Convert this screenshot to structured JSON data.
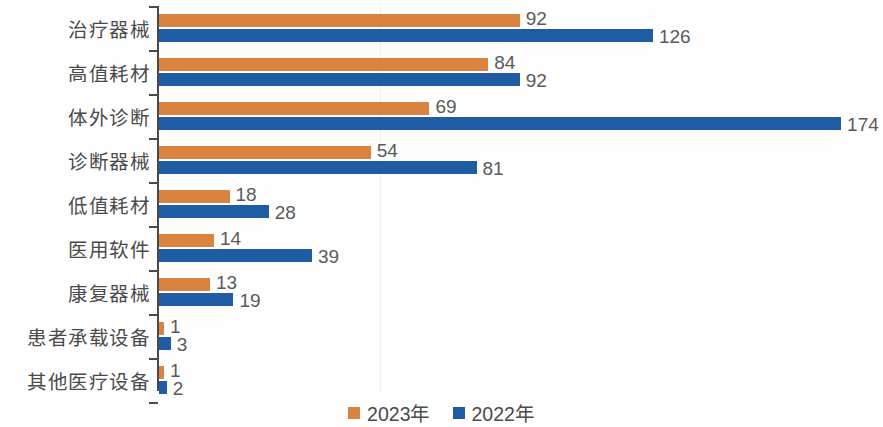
{
  "chart_data": {
    "type": "bar",
    "orientation": "horizontal",
    "title": "",
    "subtitle": "",
    "xlabel": "",
    "ylabel": "",
    "xlim": [
      0,
      180
    ],
    "grid": true,
    "legend_position": "bottom",
    "categories": [
      "治疗器械",
      "高值耗材",
      "体外诊断",
      "诊断器械",
      "低值耗材",
      "医用软件",
      "康复器械",
      "患者承载设备",
      "其他医疗设备"
    ],
    "series": [
      {
        "name": "2023年",
        "color": "#D9833E",
        "values": [
          92,
          84,
          69,
          54,
          18,
          14,
          13,
          1,
          1
        ]
      },
      {
        "name": "2022年",
        "color": "#1F5CA3",
        "values": [
          126,
          92,
          174,
          81,
          28,
          39,
          19,
          3,
          2
        ]
      }
    ],
    "value_labels": {
      "2023年": [
        "92",
        "84",
        "69",
        "54",
        "18",
        "14",
        "13",
        "1",
        "1"
      ],
      "2022年": [
        "126",
        "92",
        "174",
        "81",
        "28",
        "39",
        "19",
        "3",
        "2"
      ]
    }
  },
  "legend": {
    "items": [
      {
        "label": "2023年",
        "color": "#D9833E"
      },
      {
        "label": "2022年",
        "color": "#1F5CA3"
      }
    ]
  },
  "axis": {
    "color": "#4a4a4a",
    "gridline_color": "#f0f0ef"
  }
}
